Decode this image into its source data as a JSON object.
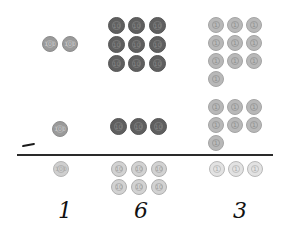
{
  "problem": {
    "operation": "subtraction",
    "operator_symbol": "-",
    "minuend": 293,
    "subtrahend": 137,
    "difference": 163
  },
  "colors": {
    "hundreds_coin": "#9a9a9a",
    "tens_coin": "#5f5f5f",
    "ones_coin": "#b8b8b8",
    "answer_coin": "#d2d2d2",
    "rule_line": "#2a2a2a"
  },
  "columns": [
    {
      "place": "hundreds",
      "top_count": 2,
      "subtract_count": 1,
      "answer_count": 1,
      "answer_digit": "1"
    },
    {
      "place": "tens",
      "top_count": 9,
      "subtract_count": 3,
      "answer_count": 6,
      "answer_digit": "6"
    },
    {
      "place": "ones",
      "top_count": 10,
      "subtract_count": 7,
      "answer_count": 3,
      "answer_digit": "3"
    }
  ],
  "coin_labels": {
    "hundreds": "100",
    "tens": "10",
    "ones": "1"
  },
  "answer": {
    "digits": [
      "1",
      "6",
      "3"
    ]
  }
}
